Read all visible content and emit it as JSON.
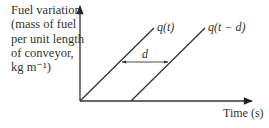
{
  "figure": {
    "y_axis_label_lines": [
      "Fuel variation",
      "(mass of fuel",
      "per unit length",
      "of conveyor,",
      "kg m⁻¹)"
    ],
    "x_axis_label": "Time (s)",
    "curves": [
      {
        "name": "q(t)",
        "label": "q(t)"
      },
      {
        "name": "q(t - d)",
        "label": "q(t − d)"
      }
    ],
    "delay_label": "d",
    "line_color": "#333333"
  }
}
